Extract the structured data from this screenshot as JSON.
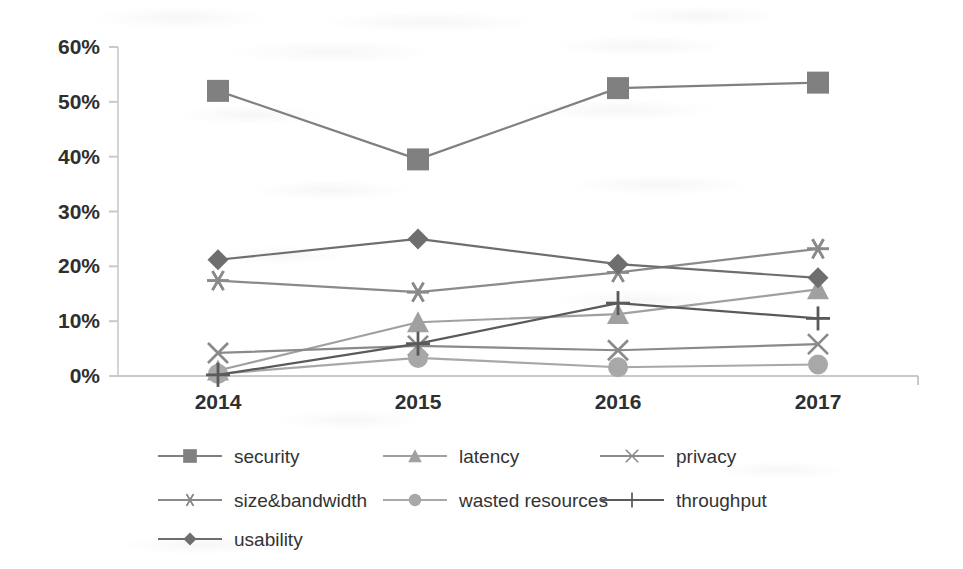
{
  "chart_data": {
    "type": "line",
    "title": "",
    "subtitle": "",
    "xlabel": "",
    "ylabel": "",
    "categories": [
      "2014",
      "2015",
      "2016",
      "2017"
    ],
    "x_tick_labels": [
      "2014",
      "2015",
      "2016",
      "2017"
    ],
    "y_tick_labels": [
      "0%",
      "10%",
      "20%",
      "30%",
      "40%",
      "50%",
      "60%"
    ],
    "y_tick_values": [
      0,
      10,
      20,
      30,
      40,
      50,
      60
    ],
    "ylim": [
      0,
      60
    ],
    "y_unit": "%",
    "grid": false,
    "legend_position": "bottom",
    "series": [
      {
        "name": "security",
        "marker": "square",
        "color": "#808080",
        "line_color": "#808080",
        "values": [
          52.0,
          39.5,
          52.5,
          53.5
        ]
      },
      {
        "name": "latency",
        "marker": "triangle",
        "color": "#a0a0a0",
        "line_color": "#a0a0a0",
        "values": [
          1.0,
          9.8,
          11.3,
          15.8
        ]
      },
      {
        "name": "privacy",
        "marker": "x",
        "color": "#8a8a8a",
        "line_color": "#8a8a8a",
        "values": [
          4.2,
          5.5,
          4.7,
          5.8
        ]
      },
      {
        "name": "size&bandwidth",
        "marker": "asterisk",
        "color": "#8a8a8a",
        "line_color": "#8a8a8a",
        "values": [
          17.4,
          15.3,
          18.9,
          23.2
        ]
      },
      {
        "name": "wasted resources",
        "marker": "circle",
        "color": "#a8a8a8",
        "line_color": "#a8a8a8",
        "values": [
          0.4,
          3.3,
          1.6,
          2.1
        ]
      },
      {
        "name": "throughput",
        "marker": "plus",
        "color": "#5a5a5a",
        "line_color": "#5a5a5a",
        "values": [
          0.2,
          5.9,
          13.3,
          10.5
        ]
      },
      {
        "name": "usability",
        "marker": "diamond",
        "color": "#6e6e6e",
        "line_color": "#6e6e6e",
        "values": [
          21.2,
          25.0,
          20.4,
          17.9
        ]
      }
    ]
  },
  "legend": {
    "rows": [
      [
        "security",
        "latency",
        "privacy"
      ],
      [
        "size&bandwidth",
        "wasted resources",
        "throughput"
      ],
      [
        "usability"
      ]
    ]
  },
  "axes": {
    "y_axis_name": "percentage-axis",
    "x_axis_name": "year-axis"
  }
}
